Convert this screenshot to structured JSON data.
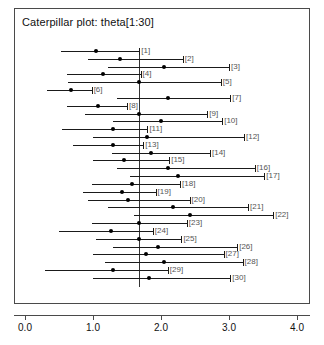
{
  "chart_data": {
    "type": "scatter",
    "title": "Caterpillar plot: theta[1:30]",
    "xlabel": "",
    "ylabel": "",
    "xlim": [
      0.0,
      4.0
    ],
    "grid": false,
    "legend": null,
    "reference_line": 1.68,
    "xticks": [
      0.0,
      1.0,
      2.0,
      3.0,
      4.0
    ],
    "xtick_labels": [
      "0.0",
      "1.0",
      "2.0",
      "3.0",
      "4.0"
    ],
    "categories": [
      "[1]",
      "[2]",
      "[3]",
      "[4]",
      "[5]",
      "[6]",
      "[7]",
      "[8]",
      "[9]",
      "[10]",
      "[11]",
      "[12]",
      "[13]",
      "[14]",
      "[15]",
      "[16]",
      "[17]",
      "[18]",
      "[19]",
      "[20]",
      "[21]",
      "[22]",
      "[23]",
      "[24]",
      "[25]",
      "[26]",
      "[27]",
      "[28]",
      "[29]",
      "[30]"
    ],
    "series": [
      {
        "name": "theta",
        "values": [
          1.05,
          1.4,
          2.04,
          1.15,
          1.68,
          0.68,
          2.1,
          1.08,
          1.68,
          2.0,
          1.3,
          1.8,
          1.3,
          1.85,
          1.46,
          2.1,
          2.25,
          1.58,
          1.42,
          1.52,
          2.18,
          2.42,
          1.68,
          1.26,
          1.68,
          1.95,
          1.78,
          2.05,
          1.3,
          1.82
        ]
      }
    ],
    "intervals": [
      {
        "label": "[1]",
        "lower": 0.53,
        "upper": 1.68,
        "point": 1.05
      },
      {
        "label": "[2]",
        "lower": 0.92,
        "upper": 2.32,
        "point": 1.4
      },
      {
        "label": "[3]",
        "lower": 1.22,
        "upper": 3.0,
        "point": 2.04
      },
      {
        "label": "[4]",
        "lower": 0.62,
        "upper": 1.7,
        "point": 1.15
      },
      {
        "label": "[5]",
        "lower": 0.63,
        "upper": 2.88,
        "point": 1.68
      },
      {
        "label": "[6]",
        "lower": 0.32,
        "upper": 0.98,
        "point": 0.68
      },
      {
        "label": "[7]",
        "lower": 1.35,
        "upper": 3.02,
        "point": 2.1
      },
      {
        "label": "[8]",
        "lower": 0.62,
        "upper": 1.5,
        "point": 1.08
      },
      {
        "label": "[9]",
        "lower": 0.88,
        "upper": 2.68,
        "point": 1.68
      },
      {
        "label": "[10]",
        "lower": 1.3,
        "upper": 2.9,
        "point": 2.0
      },
      {
        "label": "[11]",
        "lower": 0.55,
        "upper": 1.8,
        "point": 1.3
      },
      {
        "label": "[12]",
        "lower": 1.0,
        "upper": 3.22,
        "point": 1.8
      },
      {
        "label": "[13]",
        "lower": 0.7,
        "upper": 1.74,
        "point": 1.3
      },
      {
        "label": "[14]",
        "lower": 1.28,
        "upper": 2.72,
        "point": 1.85
      },
      {
        "label": "[15]",
        "lower": 1.0,
        "upper": 2.12,
        "point": 1.46
      },
      {
        "label": "[16]",
        "lower": 1.35,
        "upper": 3.38,
        "point": 2.1
      },
      {
        "label": "[17]",
        "lower": 1.55,
        "upper": 3.52,
        "point": 2.25
      },
      {
        "label": "[18]",
        "lower": 0.98,
        "upper": 2.28,
        "point": 1.58
      },
      {
        "label": "[19]",
        "lower": 0.85,
        "upper": 1.92,
        "point": 1.42
      },
      {
        "label": "[20]",
        "lower": 0.92,
        "upper": 2.42,
        "point": 1.52
      },
      {
        "label": "[21]",
        "lower": 1.22,
        "upper": 3.28,
        "point": 2.18
      },
      {
        "label": "[22]",
        "lower": 1.6,
        "upper": 3.65,
        "point": 2.42
      },
      {
        "label": "[23]",
        "lower": 0.98,
        "upper": 2.38,
        "point": 1.68
      },
      {
        "label": "[24]",
        "lower": 0.5,
        "upper": 1.88,
        "point": 1.26
      },
      {
        "label": "[25]",
        "lower": 1.05,
        "upper": 2.3,
        "point": 1.68
      },
      {
        "label": "[26]",
        "lower": 1.3,
        "upper": 3.12,
        "point": 1.95
      },
      {
        "label": "[27]",
        "lower": 1.0,
        "upper": 2.92,
        "point": 1.78
      },
      {
        "label": "[28]",
        "lower": 1.18,
        "upper": 3.2,
        "point": 2.05
      },
      {
        "label": "[29]",
        "lower": 0.3,
        "upper": 2.1,
        "point": 1.3
      },
      {
        "label": "[30]",
        "lower": 1.0,
        "upper": 3.02,
        "point": 1.82
      }
    ]
  },
  "colors": {
    "frame": "#4a4a4a",
    "line": "#1a1a1a",
    "point": "#000000",
    "label": "#555555",
    "reference": "#333333",
    "background": "#ffffff"
  }
}
